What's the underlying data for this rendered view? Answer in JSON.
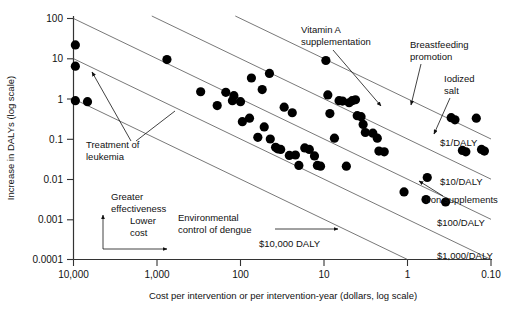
{
  "chart_data": {
    "type": "scatter",
    "title": "",
    "xlabel": "Cost per intervention or per intervention-year (dollars, log scale)",
    "ylabel": "Increase in DALYs (log scale)",
    "x_scale": "log",
    "y_scale": "log",
    "x_reversed": true,
    "xlim": [
      10000,
      0.1
    ],
    "ylim": [
      0.0001,
      100
    ],
    "grid": false,
    "legend": "none",
    "xticks": [
      {
        "value": 10000,
        "label": "10,000"
      },
      {
        "value": 1000,
        "label": "1,000"
      },
      {
        "value": 100,
        "label": "100"
      },
      {
        "value": 10,
        "label": "10"
      },
      {
        "value": 1,
        "label": "1"
      },
      {
        "value": 0.1,
        "label": "0.10"
      }
    ],
    "yticks": [
      {
        "value": 100,
        "label": "100"
      },
      {
        "value": 10,
        "label": "10"
      },
      {
        "value": 1,
        "label": "1"
      },
      {
        "value": 0.1,
        "label": "0.1"
      },
      {
        "value": 0.01,
        "label": "0.01"
      },
      {
        "value": 0.001,
        "label": "0.001"
      },
      {
        "value": 0.0001,
        "label": "0.0001"
      }
    ],
    "iso_lines": [
      {
        "label": "$1/DALY",
        "cost_per_daly": 1
      },
      {
        "label": "$10/DALY",
        "cost_per_daly": 10
      },
      {
        "label": "$100/DALY",
        "cost_per_daly": 100
      },
      {
        "label": "$1,000/DALY",
        "cost_per_daly": 1000
      },
      {
        "label": "$10,000 DALY",
        "cost_per_daly": 10000
      }
    ],
    "annotations": [
      {
        "name": "vitamin-a-supplementation",
        "text": "Vitamin A\nsupplementation"
      },
      {
        "name": "breastfeeding-promotion",
        "text": "Breastfeeding\npromotion"
      },
      {
        "name": "iodized-salt",
        "text": "Iodized\nsalt"
      },
      {
        "name": "iron-supplements",
        "text": "Iron supplements"
      },
      {
        "name": "treatment-of-leukemia",
        "text": "Treatment of\nleukemia"
      },
      {
        "name": "environmental-control-of-dengue",
        "text": "Environmental\ncontrol of dengue"
      },
      {
        "name": "greater-effectiveness",
        "text": "Greater\neffectiveness"
      },
      {
        "name": "lower-cost",
        "text": "Lower\ncost"
      }
    ],
    "points": [
      {
        "x": 9500,
        "y": 22
      },
      {
        "x": 9500,
        "y": 6.5
      },
      {
        "x": 9500,
        "y": 0.9
      },
      {
        "x": 6800,
        "y": 0.85
      },
      {
        "x": 760,
        "y": 9.5
      },
      {
        "x": 300,
        "y": 1.5
      },
      {
        "x": 190,
        "y": 0.68
      },
      {
        "x": 150,
        "y": 1.45
      },
      {
        "x": 120,
        "y": 1.2
      },
      {
        "x": 125,
        "y": 0.9
      },
      {
        "x": 100,
        "y": 0.85
      },
      {
        "x": 95,
        "y": 0.27
      },
      {
        "x": 78,
        "y": 0.33
      },
      {
        "x": 74,
        "y": 3.3
      },
      {
        "x": 62,
        "y": 0.11
      },
      {
        "x": 55,
        "y": 1.7
      },
      {
        "x": 52,
        "y": 0.2
      },
      {
        "x": 45,
        "y": 4.3
      },
      {
        "x": 44,
        "y": 0.1
      },
      {
        "x": 38,
        "y": 0.062
      },
      {
        "x": 36,
        "y": 0.057
      },
      {
        "x": 33,
        "y": 0.055
      },
      {
        "x": 30,
        "y": 0.62
      },
      {
        "x": 26,
        "y": 0.039
      },
      {
        "x": 24,
        "y": 0.45
      },
      {
        "x": 22,
        "y": 0.04
      },
      {
        "x": 20,
        "y": 0.022
      },
      {
        "x": 17,
        "y": 0.06
      },
      {
        "x": 15,
        "y": 0.055
      },
      {
        "x": 13,
        "y": 0.038
      },
      {
        "x": 12,
        "y": 0.022
      },
      {
        "x": 11,
        "y": 0.021
      },
      {
        "x": 9.5,
        "y": 9.0
      },
      {
        "x": 9.0,
        "y": 1.25
      },
      {
        "x": 8.5,
        "y": 0.43
      },
      {
        "x": 7.5,
        "y": 0.105
      },
      {
        "x": 6.6,
        "y": 0.9
      },
      {
        "x": 6.0,
        "y": 0.88
      },
      {
        "x": 5.4,
        "y": 0.021
      },
      {
        "x": 5.0,
        "y": 0.8
      },
      {
        "x": 4.6,
        "y": 0.9
      },
      {
        "x": 4.2,
        "y": 0.95
      },
      {
        "x": 4.0,
        "y": 0.38
      },
      {
        "x": 3.6,
        "y": 0.36
      },
      {
        "x": 3.4,
        "y": 0.23
      },
      {
        "x": 3.2,
        "y": 0.145
      },
      {
        "x": 2.6,
        "y": 0.14
      },
      {
        "x": 2.3,
        "y": 0.105
      },
      {
        "x": 2.2,
        "y": 0.05
      },
      {
        "x": 1.9,
        "y": 0.048
      },
      {
        "x": 1.1,
        "y": 0.0048
      },
      {
        "x": 0.6,
        "y": 0.0031
      },
      {
        "x": 0.58,
        "y": 0.011
      },
      {
        "x": 0.35,
        "y": 0.0027
      },
      {
        "x": 0.3,
        "y": 0.34
      },
      {
        "x": 0.27,
        "y": 0.3
      },
      {
        "x": 0.22,
        "y": 0.052
      },
      {
        "x": 0.2,
        "y": 0.048
      },
      {
        "x": 0.15,
        "y": 0.33
      },
      {
        "x": 0.13,
        "y": 0.055
      },
      {
        "x": 0.12,
        "y": 0.05
      }
    ]
  },
  "axes": {
    "x_title": "Cost per intervention or per intervention-year (dollars, log scale)",
    "y_title": "Increase in DALYs (log scale)"
  },
  "labels": {
    "vitamin_a": "Vitamin A",
    "vitamin_a2": "supplementation",
    "breastfeeding": "Breastfeeding",
    "breastfeeding2": "promotion",
    "iodized": "Iodized",
    "iodized2": "salt",
    "iron": "Iron supplements",
    "leukemia": "Treatment of",
    "leukemia2": "leukemia",
    "dengue": "Environmental",
    "dengue2": "control of dengue",
    "greater": "Greater",
    "greater2": "effectiveness",
    "lower": "Lower",
    "lower2": "cost",
    "daly1": "$1/DALY",
    "daly10": "$10/DALY",
    "daly100": "$100/DALY",
    "daly1000": "$1,000/DALY",
    "daly10000": "$10,000 DALY"
  },
  "ticks": {
    "x": [
      "10,000",
      "1,000",
      "100",
      "10",
      "1",
      "0.10"
    ],
    "y": [
      "100",
      "10",
      "1",
      "0.1",
      "0.01",
      "0.001",
      "0.0001"
    ]
  },
  "colors": {
    "dot": "#000000",
    "line": "#555555",
    "axis": "#333333",
    "background": "#ffffff"
  }
}
